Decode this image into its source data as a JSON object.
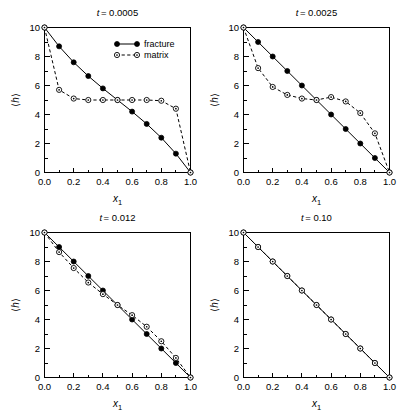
{
  "figure": {
    "layout": "2x2-grid",
    "panel_count": 4,
    "xlabel": "x",
    "xlabel_sub": "1",
    "ylabel_open": "⟨",
    "ylabel_var": "h",
    "ylabel_close": "⟩",
    "legend": {
      "position": "top-right-of-panel-1",
      "entries": [
        {
          "label": "fracture",
          "marker": "filled-circle",
          "line": "solid"
        },
        {
          "label": "matrix",
          "marker": "open-circle",
          "line": "dashed"
        }
      ]
    }
  },
  "chart_data": [
    {
      "type": "line",
      "title": "t = 0.0005",
      "title_var": "t",
      "title_value": "= 0.0005",
      "xlabel": "x1",
      "ylabel": "⟨h⟩",
      "xlim": [
        0.0,
        1.0
      ],
      "ylim": [
        0,
        10
      ],
      "xticks": [
        0.0,
        0.2,
        0.4,
        0.6,
        0.8,
        1.0
      ],
      "xticklabels": [
        "0.0",
        "0.2",
        "0.4",
        "0.6",
        "0.8",
        "1.0"
      ],
      "yticks": [
        0,
        2,
        4,
        6,
        8,
        10
      ],
      "yticklabels": [
        "0",
        "2",
        "4",
        "6",
        "8",
        "10"
      ],
      "grid": false,
      "show_legend": true,
      "x": [
        0.0,
        0.1,
        0.2,
        0.3,
        0.4,
        0.5,
        0.6,
        0.7,
        0.8,
        0.9,
        1.0
      ],
      "series": [
        {
          "name": "fracture",
          "values": [
            10.0,
            8.7,
            7.6,
            6.65,
            5.8,
            5.0,
            4.2,
            3.35,
            2.4,
            1.3,
            0.0
          ]
        },
        {
          "name": "matrix",
          "values": [
            10.0,
            5.7,
            5.1,
            5.0,
            5.0,
            5.0,
            5.0,
            5.0,
            4.95,
            4.4,
            0.0
          ]
        }
      ]
    },
    {
      "type": "line",
      "title": "t = 0.0025",
      "title_var": "t",
      "title_value": "= 0.0025",
      "xlabel": "x1",
      "ylabel": "⟨h⟩",
      "xlim": [
        0.0,
        1.0
      ],
      "ylim": [
        0,
        10
      ],
      "xticks": [
        0.0,
        0.2,
        0.4,
        0.6,
        0.8,
        1.0
      ],
      "xticklabels": [
        "0.0",
        "0.2",
        "0.4",
        "0.6",
        "0.8",
        "1.0"
      ],
      "yticks": [
        0,
        2,
        4,
        6,
        8,
        10
      ],
      "yticklabels": [
        "0",
        "2",
        "4",
        "6",
        "8",
        "10"
      ],
      "grid": false,
      "show_legend": false,
      "x": [
        0.0,
        0.1,
        0.2,
        0.3,
        0.4,
        0.5,
        0.6,
        0.7,
        0.8,
        0.9,
        1.0
      ],
      "series": [
        {
          "name": "fracture",
          "values": [
            10.0,
            9.0,
            8.0,
            7.0,
            6.0,
            5.0,
            4.0,
            3.0,
            2.0,
            1.0,
            0.0
          ]
        },
        {
          "name": "matrix",
          "values": [
            10.0,
            7.2,
            5.9,
            5.35,
            5.1,
            5.0,
            5.2,
            4.9,
            4.1,
            2.7,
            0.0
          ]
        }
      ]
    },
    {
      "type": "line",
      "title": "t = 0.012",
      "title_var": "t",
      "title_value": "= 0.012",
      "xlabel": "x1",
      "ylabel": "⟨h⟩",
      "xlim": [
        0.0,
        1.0
      ],
      "ylim": [
        0,
        10
      ],
      "xticks": [
        0.0,
        0.2,
        0.4,
        0.6,
        0.8,
        1.0
      ],
      "xticklabels": [
        "0.0",
        "0.2",
        "0.4",
        "0.6",
        "0.8",
        "1.0"
      ],
      "yticks": [
        0,
        2,
        4,
        6,
        8,
        10
      ],
      "yticklabels": [
        "0",
        "2",
        "4",
        "6",
        "8",
        "10"
      ],
      "grid": false,
      "show_legend": false,
      "x": [
        0.0,
        0.1,
        0.2,
        0.3,
        0.4,
        0.5,
        0.6,
        0.7,
        0.8,
        0.9,
        1.0
      ],
      "series": [
        {
          "name": "fracture",
          "values": [
            10.0,
            9.0,
            8.0,
            7.0,
            6.0,
            5.0,
            4.0,
            3.0,
            2.0,
            1.0,
            0.0
          ]
        },
        {
          "name": "matrix",
          "values": [
            10.0,
            8.65,
            7.55,
            6.55,
            5.75,
            5.0,
            4.3,
            3.5,
            2.5,
            1.35,
            0.0
          ]
        }
      ]
    },
    {
      "type": "line",
      "title": "t = 0.10",
      "title_var": "t",
      "title_value": "= 0.10",
      "xlabel": "x1",
      "ylabel": "⟨h⟩",
      "xlim": [
        0.0,
        1.0
      ],
      "ylim": [
        0,
        10
      ],
      "xticks": [
        0.0,
        0.2,
        0.4,
        0.6,
        0.8,
        1.0
      ],
      "xticklabels": [
        "0.0",
        "0.2",
        "0.4",
        "0.6",
        "0.8",
        "1.0"
      ],
      "yticks": [
        0,
        2,
        4,
        6,
        8,
        10
      ],
      "yticklabels": [
        "0",
        "2",
        "4",
        "6",
        "8",
        "10"
      ],
      "grid": false,
      "show_legend": false,
      "x": [
        0.0,
        0.1,
        0.2,
        0.3,
        0.4,
        0.5,
        0.6,
        0.7,
        0.8,
        0.9,
        1.0
      ],
      "series": [
        {
          "name": "fracture",
          "values": [
            10.0,
            9.0,
            8.0,
            7.0,
            6.0,
            5.0,
            4.0,
            3.0,
            2.0,
            1.0,
            0.0
          ]
        },
        {
          "name": "matrix",
          "values": [
            10.0,
            9.0,
            8.0,
            7.0,
            6.0,
            5.0,
            4.0,
            3.0,
            2.0,
            1.0,
            0.0
          ]
        }
      ]
    }
  ]
}
